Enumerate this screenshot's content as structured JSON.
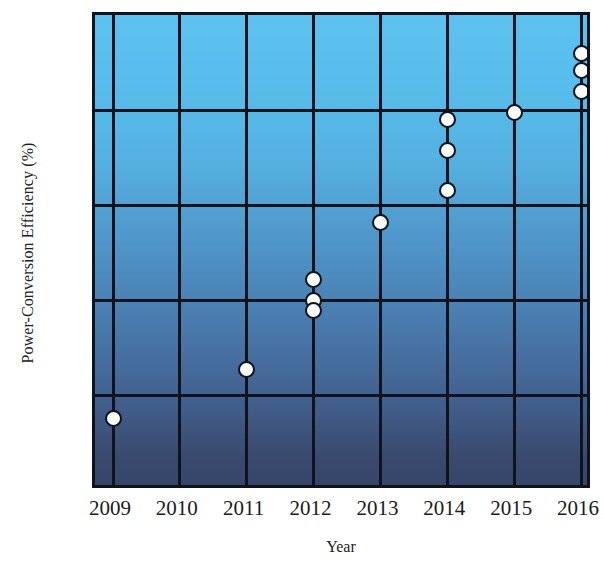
{
  "chart_data": {
    "type": "scatter",
    "title": "",
    "xlabel": "Year",
    "ylabel": "Power-Conversion Efficiency (%)",
    "xlim": [
      2009,
      2016
    ],
    "ylim": [
      0,
      25
    ],
    "xticks": [
      "2009",
      "2010",
      "2011",
      "2012",
      "2013",
      "2014",
      "2015",
      "2016"
    ],
    "yticks": [
      "0",
      "5",
      "10",
      "15",
      "20",
      "25"
    ],
    "grid": true,
    "legend": "none",
    "marker_style": "white-filled circle with black outline",
    "background": "blue vertical gradient, light at top to dark navy at bottom",
    "points": [
      {
        "x": 2009,
        "y": 3.8
      },
      {
        "x": 2011,
        "y": 6.4
      },
      {
        "x": 2012,
        "y": 11.1
      },
      {
        "x": 2012,
        "y": 10.0
      },
      {
        "x": 2012,
        "y": 9.5
      },
      {
        "x": 2013,
        "y": 14.1
      },
      {
        "x": 2014,
        "y": 19.5
      },
      {
        "x": 2014,
        "y": 17.9
      },
      {
        "x": 2014,
        "y": 15.8
      },
      {
        "x": 2015,
        "y": 19.9
      },
      {
        "x": 2016,
        "y": 23.0
      },
      {
        "x": 2016,
        "y": 22.1
      },
      {
        "x": 2016,
        "y": 21.0
      }
    ]
  },
  "colors": {
    "gradient_top": "#5ec2f0",
    "gradient_bottom": "#36456a",
    "axis": "#10131c",
    "marker_fill": "#fdfdfa",
    "text": "#1b1b1b"
  }
}
